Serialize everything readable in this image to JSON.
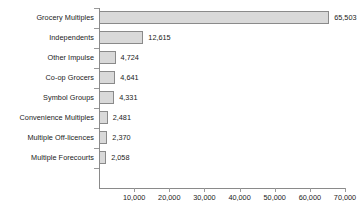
{
  "chart_data": {
    "type": "bar",
    "orientation": "horizontal",
    "title": "",
    "xlabel": "",
    "ylabel": "",
    "xlim": [
      0,
      70000
    ],
    "xticks": [
      10000,
      20000,
      30000,
      40000,
      50000,
      60000,
      70000
    ],
    "xtick_labels": [
      "10,000",
      "20,000",
      "30,000",
      "40,000",
      "50,000",
      "60,000",
      "70,000"
    ],
    "grid": false,
    "legend": false,
    "categories": [
      "Grocery Multiples",
      "Independents",
      "Other Impulse",
      "Co-op Grocers",
      "Symbol Groups",
      "Convenience Multiples",
      "Multiple Off-licences",
      "Multiple Forecourts"
    ],
    "values": [
      65503,
      12615,
      4724,
      4641,
      4331,
      2481,
      2370,
      2058
    ],
    "value_labels": [
      "65,503",
      "12,615",
      "4,724",
      "4,641",
      "4,331",
      "2,481",
      "2,370",
      "2,058"
    ],
    "bar_fill_color": "#d9d9d9",
    "bar_border_color": "#8a8a8a",
    "axis_color": "#8a8a8a",
    "text_color": "#1a1a1a",
    "background_color": "#ffffff"
  }
}
